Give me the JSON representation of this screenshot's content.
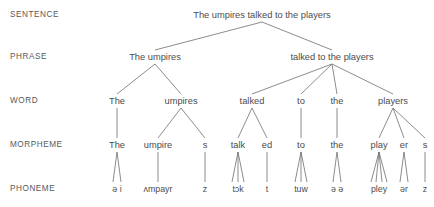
{
  "diagram": {
    "line_color": "#6e6e70",
    "text_color": "#4c4c4e",
    "label_color": "#58585a",
    "background": "#ffffff"
  },
  "row_labels": [
    {
      "name": "sentence",
      "text": "SENTENCE",
      "x": 10,
      "y": 16
    },
    {
      "name": "phrase",
      "text": "PHRASE",
      "x": 10,
      "y": 58
    },
    {
      "name": "word",
      "text": "WORD",
      "x": 10,
      "y": 102
    },
    {
      "name": "morpheme",
      "text": "MORPHEME",
      "x": 10,
      "y": 146
    },
    {
      "name": "phoneme",
      "text": "PHONEME",
      "x": 10,
      "y": 190
    }
  ],
  "levels": {
    "sentence": {
      "y": 16,
      "nodes": [
        {
          "id": "s1",
          "text": "The umpires talked to the players",
          "x": 262
        }
      ]
    },
    "phrase": {
      "y": 58,
      "nodes": [
        {
          "id": "p1",
          "text": "The umpires",
          "x": 155
        },
        {
          "id": "p2",
          "text": "talked to the players",
          "x": 332
        }
      ]
    },
    "word": {
      "y": 102,
      "nodes": [
        {
          "id": "w1",
          "text": "The",
          "x": 117
        },
        {
          "id": "w2",
          "text": "umpires",
          "x": 181
        },
        {
          "id": "w3",
          "text": "talked",
          "x": 252
        },
        {
          "id": "w4",
          "text": "to",
          "x": 301
        },
        {
          "id": "w5",
          "text": "the",
          "x": 337
        },
        {
          "id": "w6",
          "text": "players",
          "x": 393
        }
      ]
    },
    "morpheme": {
      "y": 146,
      "nodes": [
        {
          "id": "m1",
          "text": "The",
          "x": 117
        },
        {
          "id": "m2",
          "text": "umpire",
          "x": 158
        },
        {
          "id": "m3",
          "text": "s",
          "x": 205
        },
        {
          "id": "m4",
          "text": "talk",
          "x": 238
        },
        {
          "id": "m5",
          "text": "ed",
          "x": 267
        },
        {
          "id": "m6",
          "text": "to",
          "x": 301
        },
        {
          "id": "m7",
          "text": "the",
          "x": 337
        },
        {
          "id": "m8",
          "text": "play",
          "x": 379
        },
        {
          "id": "m9",
          "text": "er",
          "x": 404
        },
        {
          "id": "m10",
          "text": "s",
          "x": 425
        }
      ]
    },
    "phoneme": {
      "y": 190,
      "nodes": [
        {
          "id": "f1",
          "text": "ə i",
          "x": 117
        },
        {
          "id": "f2",
          "text": "ʌmpayr",
          "x": 158
        },
        {
          "id": "f3",
          "text": "z",
          "x": 205
        },
        {
          "id": "f4",
          "text": "tɔk",
          "x": 238
        },
        {
          "id": "f5",
          "text": "t",
          "x": 267
        },
        {
          "id": "f6",
          "text": "tuw",
          "x": 301
        },
        {
          "id": "f7",
          "text": "ə ə",
          "x": 337
        },
        {
          "id": "f8",
          "text": "pley",
          "x": 379
        },
        {
          "id": "f9",
          "text": "ər",
          "x": 404
        },
        {
          "id": "f10",
          "text": "z",
          "x": 425
        }
      ]
    }
  },
  "edges": [
    {
      "name": "sentence-to-phrase-1",
      "x1": 262,
      "y1": 22,
      "x2": 155,
      "y2": 50
    },
    {
      "name": "sentence-to-phrase-2",
      "x1": 262,
      "y1": 22,
      "x2": 332,
      "y2": 50
    },
    {
      "name": "phrase1-to-word-the",
      "x1": 155,
      "y1": 64,
      "x2": 117,
      "y2": 94
    },
    {
      "name": "phrase1-to-word-umpires",
      "x1": 155,
      "y1": 64,
      "x2": 181,
      "y2": 94
    },
    {
      "name": "phrase2-to-word-talked",
      "x1": 332,
      "y1": 64,
      "x2": 252,
      "y2": 94
    },
    {
      "name": "phrase2-to-word-to",
      "x1": 332,
      "y1": 64,
      "x2": 301,
      "y2": 94
    },
    {
      "name": "phrase2-to-word-the",
      "x1": 332,
      "y1": 64,
      "x2": 337,
      "y2": 94
    },
    {
      "name": "phrase2-to-word-players",
      "x1": 332,
      "y1": 64,
      "x2": 393,
      "y2": 94
    },
    {
      "name": "word-the-to-morpheme",
      "x1": 117,
      "y1": 108,
      "x2": 117,
      "y2": 138
    },
    {
      "name": "word-umpires-to-morpheme-umpire",
      "x1": 181,
      "y1": 108,
      "x2": 158,
      "y2": 138
    },
    {
      "name": "word-umpires-to-morpheme-s",
      "x1": 181,
      "y1": 108,
      "x2": 205,
      "y2": 138
    },
    {
      "name": "word-talked-to-morpheme-talk",
      "x1": 252,
      "y1": 108,
      "x2": 238,
      "y2": 138
    },
    {
      "name": "word-talked-to-morpheme-ed",
      "x1": 252,
      "y1": 108,
      "x2": 267,
      "y2": 138
    },
    {
      "name": "word-to-to-morpheme",
      "x1": 301,
      "y1": 108,
      "x2": 301,
      "y2": 138
    },
    {
      "name": "word-the2-to-morpheme",
      "x1": 337,
      "y1": 108,
      "x2": 337,
      "y2": 138
    },
    {
      "name": "word-players-to-morpheme-play",
      "x1": 393,
      "y1": 108,
      "x2": 379,
      "y2": 138
    },
    {
      "name": "word-players-to-morpheme-er",
      "x1": 393,
      "y1": 108,
      "x2": 404,
      "y2": 138
    },
    {
      "name": "word-players-to-morpheme-s",
      "x1": 393,
      "y1": 108,
      "x2": 425,
      "y2": 138
    },
    {
      "name": "morpheme-the-to-phoneme-1",
      "x1": 117,
      "y1": 152,
      "x2": 113,
      "y2": 182
    },
    {
      "name": "morpheme-the-to-phoneme-2",
      "x1": 117,
      "y1": 152,
      "x2": 121,
      "y2": 182
    },
    {
      "name": "morpheme-umpire-to-phoneme",
      "x1": 158,
      "y1": 152,
      "x2": 158,
      "y2": 182
    },
    {
      "name": "morpheme-s1-to-phoneme",
      "x1": 205,
      "y1": 152,
      "x2": 205,
      "y2": 182
    },
    {
      "name": "morpheme-talk-to-phoneme-1",
      "x1": 238,
      "y1": 152,
      "x2": 232,
      "y2": 182
    },
    {
      "name": "morpheme-talk-to-phoneme-2",
      "x1": 238,
      "y1": 152,
      "x2": 238,
      "y2": 182
    },
    {
      "name": "morpheme-talk-to-phoneme-3",
      "x1": 238,
      "y1": 152,
      "x2": 244,
      "y2": 182
    },
    {
      "name": "morpheme-ed-to-phoneme",
      "x1": 267,
      "y1": 152,
      "x2": 267,
      "y2": 182
    },
    {
      "name": "morpheme-to-to-phoneme-1",
      "x1": 301,
      "y1": 152,
      "x2": 295,
      "y2": 182
    },
    {
      "name": "morpheme-to-to-phoneme-2",
      "x1": 301,
      "y1": 152,
      "x2": 301,
      "y2": 182
    },
    {
      "name": "morpheme-to-to-phoneme-3",
      "x1": 301,
      "y1": 152,
      "x2": 307,
      "y2": 182
    },
    {
      "name": "morpheme-the2-to-phoneme-1",
      "x1": 337,
      "y1": 152,
      "x2": 333,
      "y2": 182
    },
    {
      "name": "morpheme-the2-to-phoneme-2",
      "x1": 337,
      "y1": 152,
      "x2": 341,
      "y2": 182
    },
    {
      "name": "morpheme-play-to-phoneme-1",
      "x1": 379,
      "y1": 152,
      "x2": 371,
      "y2": 182
    },
    {
      "name": "morpheme-play-to-phoneme-2",
      "x1": 379,
      "y1": 152,
      "x2": 376,
      "y2": 182
    },
    {
      "name": "morpheme-play-to-phoneme-3",
      "x1": 379,
      "y1": 152,
      "x2": 382,
      "y2": 182
    },
    {
      "name": "morpheme-play-to-phoneme-4",
      "x1": 379,
      "y1": 152,
      "x2": 387,
      "y2": 182
    },
    {
      "name": "morpheme-er-to-phoneme-1",
      "x1": 404,
      "y1": 152,
      "x2": 400,
      "y2": 182
    },
    {
      "name": "morpheme-er-to-phoneme-2",
      "x1": 404,
      "y1": 152,
      "x2": 408,
      "y2": 182
    },
    {
      "name": "morpheme-s2-to-phoneme",
      "x1": 425,
      "y1": 152,
      "x2": 425,
      "y2": 182
    }
  ]
}
